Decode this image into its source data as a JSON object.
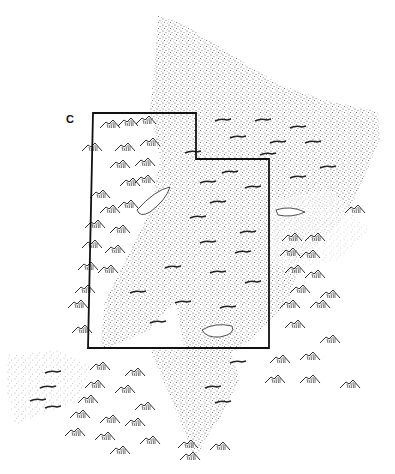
{
  "figure": {
    "panel_label": "C",
    "colors": {
      "background": "#ffffff",
      "stipple": "#2a2a2a",
      "outline": "#111111",
      "mountain_ink": "#1a1a1a"
    }
  },
  "map": {
    "outline_label": "state-boundary",
    "stippled_regions": [
      {
        "name": "northern-plateau-stipple"
      },
      {
        "name": "central-stipple-band"
      },
      {
        "name": "southwest-stipple-patch"
      },
      {
        "name": "southern-stipple-tongue"
      }
    ],
    "lakes": [
      {
        "name": "northwest-lake"
      },
      {
        "name": "eastern-lake"
      },
      {
        "name": "southern-lake"
      }
    ]
  }
}
